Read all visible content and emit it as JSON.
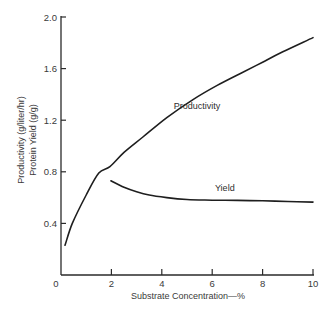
{
  "chart_data": {
    "type": "line",
    "title": "",
    "xlabel": "Substrate Concentration—%",
    "ylabel_lines": [
      "Productivity (g/liter/hr)",
      "Protein Yield (g/g)"
    ],
    "xlim": [
      0,
      10
    ],
    "ylim": [
      0,
      2.0
    ],
    "x_ticks": [
      0,
      2,
      4,
      6,
      8,
      10
    ],
    "x_tick_labels": [
      "0",
      "2",
      "4",
      "6",
      "8",
      "10"
    ],
    "y_ticks": [
      0.4,
      0.8,
      1.2,
      1.6,
      2.0
    ],
    "y_tick_labels": [
      "0.4",
      "0.8",
      "1.2",
      "1.6",
      "2.0"
    ],
    "grid": false,
    "legend": "none (inline curve labels)",
    "series": [
      {
        "name": "Productivity",
        "label_pos": {
          "x": 5.4,
          "y": 1.29
        },
        "x": [
          0.16,
          0.45,
          1.0,
          1.5,
          1.94,
          2.5,
          3.25,
          4.2,
          5.24,
          6.2,
          7.2,
          8.0,
          8.8,
          10.0
        ],
        "y": [
          0.23,
          0.4,
          0.62,
          0.79,
          0.84,
          0.95,
          1.07,
          1.22,
          1.36,
          1.47,
          1.57,
          1.65,
          1.73,
          1.84
        ]
      },
      {
        "name": "Yield",
        "label_pos": {
          "x": 6.5,
          "y": 0.655
        },
        "x": [
          1.98,
          2.5,
          3.0,
          3.5,
          4.2,
          5.0,
          6.0,
          7.0,
          8.0,
          9.0,
          10.0
        ],
        "y": [
          0.73,
          0.68,
          0.645,
          0.62,
          0.6,
          0.585,
          0.58,
          0.578,
          0.575,
          0.57,
          0.565
        ]
      }
    ]
  }
}
